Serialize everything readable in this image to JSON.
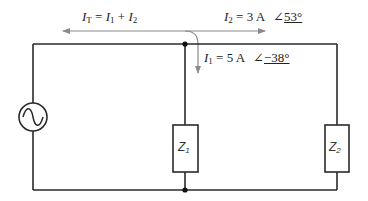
{
  "diagram": {
    "type": "AC parallel circuit",
    "colors": {
      "wire": "#2a2a2a",
      "arrow": "#8a8a8a",
      "text": "#222222"
    },
    "labels": {
      "total_current": {
        "lhs_symbol": "I",
        "lhs_sub": "T",
        "eq": " = ",
        "term1_symbol": "I",
        "term1_sub": "1",
        "plus": " + ",
        "term2_symbol": "I",
        "term2_sub": "2"
      },
      "i2": {
        "symbol": "I",
        "sub": "2",
        "value": " = 3 A",
        "angle_symbol": "∠",
        "angle_value": "53°"
      },
      "i1": {
        "symbol": "I",
        "sub": "1",
        "value": " = 5 A",
        "angle_symbol": "∠",
        "angle_value": "−38°"
      },
      "z1": {
        "symbol": "Z",
        "sub": "1"
      },
      "z2": {
        "symbol": "Z",
        "sub": "2"
      }
    },
    "components": [
      {
        "id": "source",
        "kind": "ac-voltage-source",
        "glyph": "sine-wave-icon"
      },
      {
        "id": "Z1",
        "kind": "impedance"
      },
      {
        "id": "Z2",
        "kind": "impedance"
      }
    ]
  }
}
